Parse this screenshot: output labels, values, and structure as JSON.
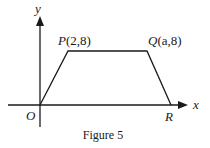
{
  "figure": {
    "caption": "Figure 5",
    "axes": {
      "x_label": "x",
      "y_label": "y",
      "origin_label": "O"
    },
    "points": {
      "P": {
        "name": "P",
        "coords": "(2,8)"
      },
      "Q": {
        "name": "Q",
        "coords": "(a,8)"
      },
      "R": {
        "name": "R"
      }
    },
    "shape": "trapezium O-P-Q-R",
    "colors": {
      "line": "#1a1a1a",
      "background": "#ffffff"
    }
  }
}
